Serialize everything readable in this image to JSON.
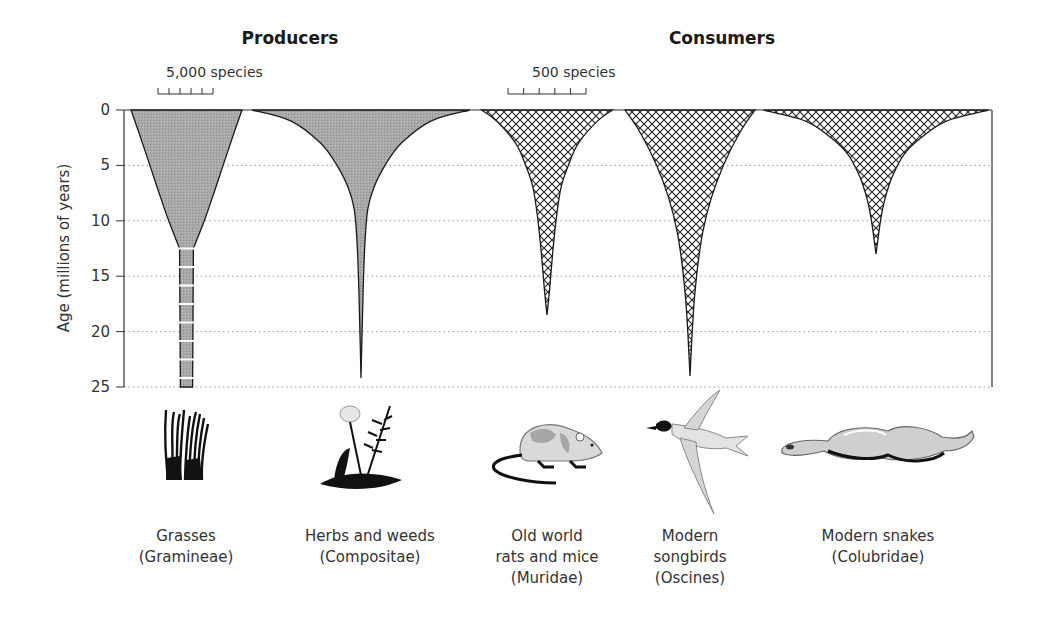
{
  "chart_data": {
    "type": "area",
    "subtype": "spindle-diagram",
    "ylabel": "Age (millions of years)",
    "ylim": [
      0,
      25
    ],
    "y_ticks": [
      "0",
      "5",
      "10",
      "15",
      "20",
      "25"
    ],
    "y_tick_values": [
      0,
      5,
      10,
      15,
      20,
      25
    ],
    "grid": "dotted-horizontal",
    "groups": [
      {
        "name": "Producers",
        "scale_bar": {
          "label": "5,000 species",
          "species": 5000,
          "divisions": 5
        },
        "fill": "stipple-gray"
      },
      {
        "name": "Consumers",
        "scale_bar": {
          "label": "500 species",
          "species": 500,
          "divisions": 5
        },
        "fill": "crosshatch"
      }
    ],
    "series": [
      {
        "group": "Producers",
        "name": "Grasses",
        "family": "(Gramineae)",
        "label_lines": [
          "Grasses",
          "(Gramineae)"
        ],
        "illustration": "grass-icon",
        "origin_age_myr": 25,
        "extends_beyond_axis": true,
        "uncertain_from_age_myr": 12.5,
        "present_species_approx": 10000,
        "profile": [
          [
            0,
            10000
          ],
          [
            2,
            8600
          ],
          [
            5,
            6600
          ],
          [
            8,
            4600
          ],
          [
            10,
            3200
          ],
          [
            12.5,
            1250
          ],
          [
            25,
            1100
          ]
        ]
      },
      {
        "group": "Producers",
        "name": "Herbs and weeds",
        "family": "(Compositae)",
        "label_lines": [
          "Herbs and weeds",
          "(Compositae)"
        ],
        "illustration": "dandelion-icon",
        "origin_age_myr": 24.2,
        "present_species_approx": 19500,
        "profile": [
          [
            0,
            19500
          ],
          [
            1,
            12500
          ],
          [
            3,
            7200
          ],
          [
            5,
            4300
          ],
          [
            7,
            2300
          ],
          [
            9,
            1200
          ],
          [
            12,
            700
          ],
          [
            16,
            400
          ],
          [
            20,
            200
          ],
          [
            24.2,
            0
          ]
        ]
      },
      {
        "group": "Consumers",
        "name": "Old world rats and mice",
        "family": "(Muridae)",
        "label_lines": [
          "Old world",
          "rats and mice",
          "(Muridae)"
        ],
        "illustration": "rat-icon",
        "origin_age_myr": 18.5,
        "present_species_approx": 1170,
        "profile": [
          [
            0,
            1170
          ],
          [
            1,
            900
          ],
          [
            3,
            560
          ],
          [
            5,
            380
          ],
          [
            7,
            250
          ],
          [
            10,
            160
          ],
          [
            13,
            100
          ],
          [
            16,
            50
          ],
          [
            18.5,
            0
          ]
        ]
      },
      {
        "group": "Consumers",
        "name": "Modern songbirds",
        "family": "(Oscines)",
        "label_lines": [
          "Modern",
          "songbirds",
          "(Oscines)"
        ],
        "illustration": "songbird-icon",
        "origin_age_myr": 24,
        "present_species_approx": 1170,
        "profile": [
          [
            0,
            1170
          ],
          [
            2,
            900
          ],
          [
            5,
            600
          ],
          [
            8,
            380
          ],
          [
            11,
            230
          ],
          [
            14,
            140
          ],
          [
            17,
            80
          ],
          [
            20,
            40
          ],
          [
            24,
            0
          ]
        ]
      },
      {
        "group": "Consumers",
        "name": "Modern snakes",
        "family": "(Colubridae)",
        "label_lines": [
          "Modern snakes",
          "(Colubridae)"
        ],
        "illustration": "snake-icon",
        "origin_age_myr": 13,
        "present_species_approx": 2000,
        "profile": [
          [
            0,
            2000
          ],
          [
            1,
            1250
          ],
          [
            2.5,
            800
          ],
          [
            4,
            500
          ],
          [
            6,
            290
          ],
          [
            8,
            160
          ],
          [
            10,
            80
          ],
          [
            13,
            0
          ]
        ]
      }
    ]
  }
}
